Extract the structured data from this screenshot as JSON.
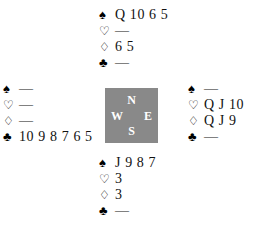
{
  "diagram": {
    "kind": "bridge-hand-diagram",
    "background_color": "#ffffff",
    "text_color": "#111111"
  },
  "suits": {
    "spade": {
      "symbol": "♠",
      "name": "spade-suit-icon",
      "filled": true
    },
    "heart": {
      "symbol": "♡",
      "name": "heart-suit-icon",
      "filled": false
    },
    "diamond": {
      "symbol": "♢",
      "name": "diamond-suit-icon",
      "filled": false
    },
    "club": {
      "symbol": "♣",
      "name": "club-suit-icon",
      "filled": true
    }
  },
  "void_marker": "—",
  "compass": {
    "background_color": "#898989",
    "label_color": "#ffffff",
    "north": "N",
    "west": "W",
    "east": "E",
    "south": "S"
  },
  "hands": {
    "north": {
      "position": "North",
      "spades": "Q 10 6 5",
      "hearts": "—",
      "diamonds": "6 5",
      "clubs": "—"
    },
    "west": {
      "position": "West",
      "spades": "—",
      "hearts": "—",
      "diamonds": "—",
      "clubs": "10 9 8 7 6 5"
    },
    "east": {
      "position": "East",
      "spades": "—",
      "hearts": "Q J 10",
      "diamonds": "Q J 9",
      "clubs": "—"
    },
    "south": {
      "position": "South",
      "spades": "J 9 8 7",
      "hearts": "3",
      "diamonds": "3",
      "clubs": "—"
    }
  }
}
